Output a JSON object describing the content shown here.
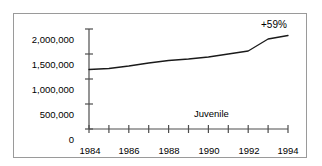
{
  "chart_data": {
    "type": "line",
    "title": "",
    "subtitle": "",
    "xlabel": "",
    "ylabel": "",
    "x": [
      1984,
      1985,
      1986,
      1987,
      1988,
      1989,
      1990,
      1991,
      1992,
      1993,
      1994
    ],
    "series": [
      {
        "name": "Juvenile",
        "values": [
          1190000,
          1210000,
          1260000,
          1320000,
          1370000,
          1400000,
          1440000,
          1500000,
          1560000,
          1800000,
          1870000
        ]
      }
    ],
    "xlim": [
      1984,
      1994
    ],
    "ylim": [
      0,
      2000000
    ],
    "yticks": [
      0,
      500000,
      1000000,
      1500000,
      2000000
    ],
    "ytick_labels": [
      "0",
      "500,000",
      "1,000,000",
      "1,500,000",
      "2,000,000"
    ],
    "xticks": [
      1984,
      1985,
      1986,
      1987,
      1988,
      1989,
      1990,
      1991,
      1992,
      1993,
      1994
    ],
    "xtick_labels": [
      "1984",
      "",
      "1986",
      "",
      "1988",
      "",
      "1990",
      "",
      "1992",
      "",
      "1994"
    ],
    "xtick_labels_visible": [
      "1984",
      "1986",
      "1988",
      "1990",
      "1992",
      "1994"
    ],
    "grid": false,
    "legend": "none",
    "annotations": [
      {
        "name": "percent-change",
        "text": "+59%",
        "x": 1994,
        "y": 2000000
      },
      {
        "name": "series-label",
        "text": "Juvenile",
        "x": 1990,
        "y": 430000
      }
    ],
    "line_color": "#1a1a1a",
    "axis_color": "#4d4d4d",
    "frame_color": "#9a9a9a",
    "background_color": "#ffffff"
  }
}
